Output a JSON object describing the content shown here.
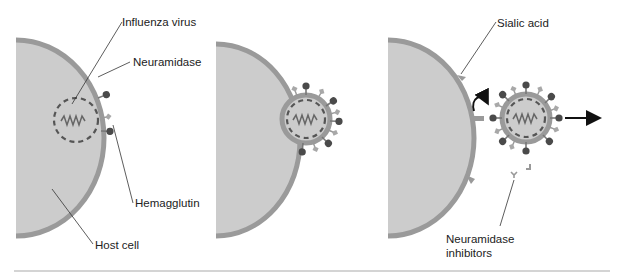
{
  "labels": {
    "influenza_virus": "Influenza virus",
    "neuramidase": "Neuramidase",
    "hemagglutin": "Hemagglutin",
    "host_cell": "Host cell",
    "sialic_acid": "Sialic acid",
    "neuramidase_inhibitors_line1": "Neuramidase",
    "neuramidase_inhibitors_line2": "inhibitors"
  },
  "panels": [
    {
      "id": 1,
      "description": "Virus budding inside host cell membrane"
    },
    {
      "id": 2,
      "description": "Virus emerging from host cell surface"
    },
    {
      "id": 3,
      "description": "Virus released; neuramidase inhibitors block cleavage of sialic acid"
    }
  ],
  "colors": {
    "cell_fill": "#cccccc",
    "membrane": "#999999",
    "hemagglutinin": "#555555",
    "neuraminidase": "#aaaaaa",
    "dashed_capsid": "#555555",
    "rna": "#666666",
    "arrow": "#111111",
    "rule": "#aaaaaa"
  }
}
